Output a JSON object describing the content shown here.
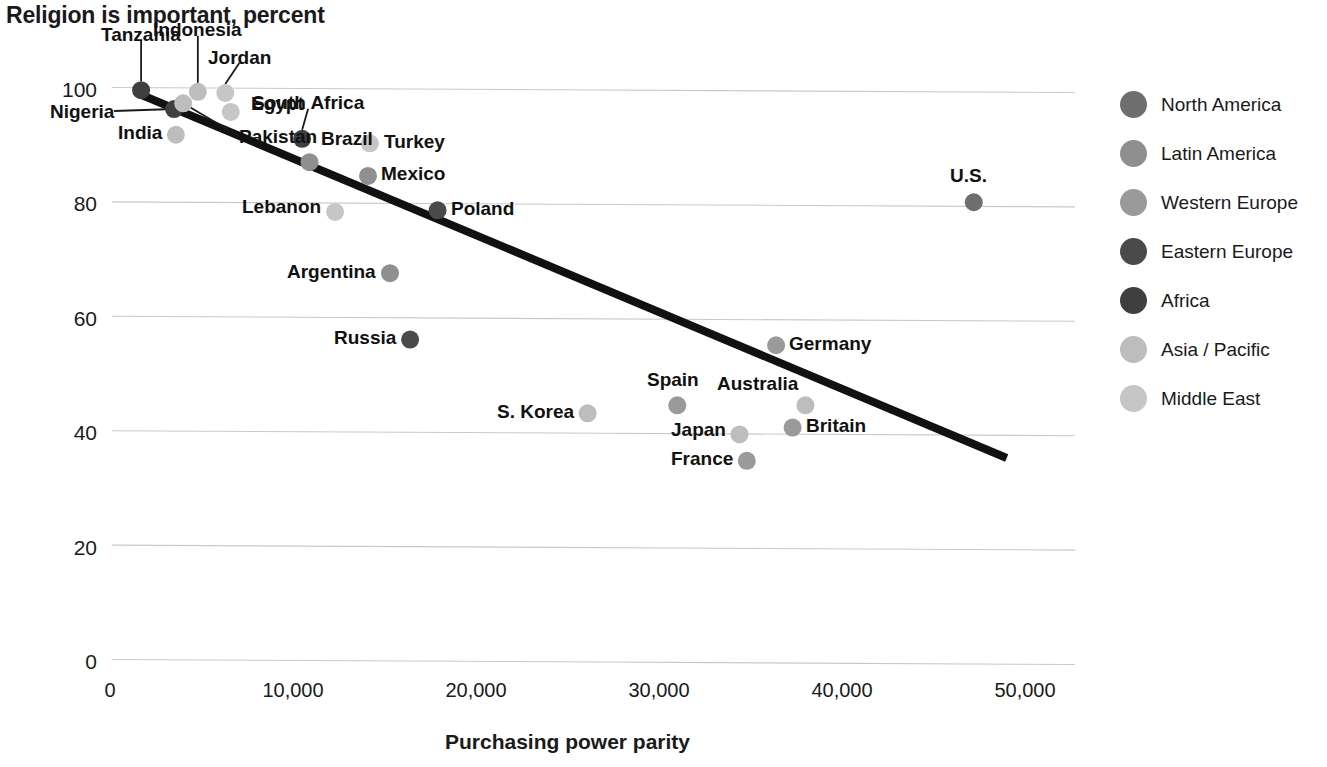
{
  "chart_data": {
    "type": "scatter",
    "title": "Religion is important, percent",
    "xlabel": "Purchasing power parity",
    "ylabel": "",
    "xlim": [
      0,
      50000
    ],
    "ylim": [
      0,
      105
    ],
    "xticks": [
      "0",
      "10,000",
      "20,000",
      "30,000",
      "40,000",
      "50,000"
    ],
    "xtick_values": [
      0,
      10000,
      20000,
      30000,
      40000,
      50000
    ],
    "yticks": [
      "0",
      "20",
      "40",
      "60",
      "80",
      "100"
    ],
    "ytick_values": [
      0,
      20,
      40,
      60,
      80,
      100
    ],
    "grid": "horizontal",
    "legend_position": "right",
    "trendline": {
      "label": "trend-line",
      "x_start": 1700,
      "y_start": 99,
      "x_end": 49000,
      "y_end": 35.5,
      "color": "#111111"
    },
    "series": [
      {
        "name": "North America",
        "color": "#6e6e6e",
        "points": [
          {
            "label": "U.S.",
            "x": 47200,
            "y": 80.2,
            "label_dx": -5,
            "label_dy": -27,
            "label_anchor": "middle"
          }
        ]
      },
      {
        "name": "Latin America",
        "color": "#8f8f8f",
        "points": [
          {
            "label": "Brazil",
            "x": 10900,
            "y": 87.2,
            "label_dx": 12,
            "label_dy": -24,
            "label_anchor": "start"
          },
          {
            "label": "Mexico",
            "x": 14100,
            "y": 84.8,
            "label_dx": 13,
            "label_dy": -2,
            "label_anchor": "start"
          },
          {
            "label": "Argentina",
            "x": 15300,
            "y": 67.8,
            "label_dx": -14,
            "label_dy": -2,
            "label_anchor": "end"
          }
        ]
      },
      {
        "name": "Western Europe",
        "color": "#9a9a9a",
        "points": [
          {
            "label": "Germany",
            "x": 36400,
            "y": 55.2,
            "label_dx": 13,
            "label_dy": -2,
            "label_anchor": "start"
          },
          {
            "label": "Spain",
            "x": 31000,
            "y": 44.7,
            "label_dx": -4,
            "label_dy": -26,
            "label_anchor": "middle"
          },
          {
            "label": "Britain",
            "x": 37300,
            "y": 40.8,
            "label_dx": 13,
            "label_dy": -2,
            "label_anchor": "start"
          },
          {
            "label": "France",
            "x": 34800,
            "y": 35.0,
            "label_dx": -14,
            "label_dy": -2,
            "label_anchor": "end"
          }
        ]
      },
      {
        "name": "Eastern Europe",
        "color": "#4a4a4a",
        "points": [
          {
            "label": "Poland",
            "x": 17900,
            "y": 78.8,
            "label_dx": 13,
            "label_dy": -2,
            "label_anchor": "start"
          },
          {
            "label": "Russia",
            "x": 16400,
            "y": 56.2,
            "label_dx": -14,
            "label_dy": -2,
            "label_anchor": "end"
          }
        ]
      },
      {
        "name": "Africa",
        "color": "#3f3f3f",
        "points": [
          {
            "label": "Tanzania",
            "x": 1700,
            "y": 99.8,
            "label_dx": 0,
            "label_dy": -56,
            "label_anchor": "middle",
            "leader": true
          },
          {
            "label": "Nigeria",
            "x": 3500,
            "y": 96.5,
            "label_dx": -60,
            "label_dy": 2,
            "label_anchor": "end",
            "leader": true
          },
          {
            "label": "South Africa",
            "x": 10500,
            "y": 91.3,
            "label_dx": 6,
            "label_dy": -36,
            "label_anchor": "middle",
            "leader": true
          }
        ]
      },
      {
        "name": "Asia / Pacific",
        "color": "#bdbdbd",
        "points": [
          {
            "label": "Indonesia",
            "x": 4800,
            "y": 99.5,
            "label_dx": 0,
            "label_dy": -62,
            "label_anchor": "middle",
            "leader": true
          },
          {
            "label": "Pakistan",
            "x": 4000,
            "y": 97.5,
            "label_dx": 56,
            "label_dy": 33,
            "label_anchor": "start",
            "leader": true
          },
          {
            "label": "India",
            "x": 3600,
            "y": 92.0,
            "label_dx": -14,
            "label_dy": -2,
            "label_anchor": "end"
          },
          {
            "label": "S. Korea",
            "x": 26100,
            "y": 43.3,
            "label_dx": -14,
            "label_dy": -2,
            "label_anchor": "end"
          },
          {
            "label": "Japan",
            "x": 34400,
            "y": 39.6,
            "label_dx": -14,
            "label_dy": -5,
            "label_anchor": "end"
          },
          {
            "label": "Australia",
            "x": 38000,
            "y": 44.7,
            "label_dx": -7,
            "label_dy": -22,
            "label_anchor": "end"
          }
        ]
      },
      {
        "name": "Middle East",
        "color": "#c6c6c6",
        "points": [
          {
            "label": "Jordan",
            "x": 6300,
            "y": 99.3,
            "label_dx": 14,
            "label_dy": -36,
            "label_anchor": "middle",
            "leader": true
          },
          {
            "label": "Egypt",
            "x": 6600,
            "y": 96.0,
            "label_dx": 20,
            "label_dy": -8,
            "label_anchor": "start"
          },
          {
            "label": "Turkey",
            "x": 14200,
            "y": 90.5,
            "label_dx": 14,
            "label_dy": -2,
            "label_anchor": "start"
          },
          {
            "label": "Lebanon",
            "x": 12300,
            "y": 78.5,
            "label_dx": -14,
            "label_dy": -5,
            "label_anchor": "end"
          }
        ]
      }
    ]
  }
}
